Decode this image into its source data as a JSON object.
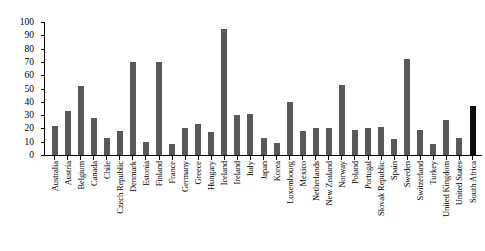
{
  "chart_data": {
    "type": "bar",
    "title": "",
    "subtitle": "",
    "xlabel": "",
    "ylabel": "",
    "ylim": [
      0,
      100
    ],
    "yticks": [
      0,
      10,
      20,
      30,
      40,
      50,
      60,
      70,
      80,
      90,
      100
    ],
    "grid": false,
    "legend": "none",
    "bar_color": "#595959",
    "highlight_color": "#0d0d0d",
    "highlight_category": "South Africa",
    "categories": [
      "Australia",
      "Austria",
      "Belgium",
      "Canada",
      "Chile",
      "Czech Republic",
      "Denmark",
      "Estonia",
      "Finland",
      "France",
      "Germany",
      "Greece",
      "Hungary",
      "Iceland",
      "Ireland",
      "Italy",
      "Japan",
      "Korea",
      "Luxembourg",
      "Mexico",
      "Netherlands",
      "New Zealand",
      "Norway",
      "Poland",
      "Portugal",
      "Slovak Republic",
      "Spain",
      "Sweden",
      "Switzerland",
      "Turkey",
      "United Kingdom",
      "United States",
      "South Africa"
    ],
    "values": [
      22,
      33,
      52,
      28,
      13,
      18,
      70,
      10,
      70,
      8,
      20,
      23,
      17,
      95,
      30,
      31,
      13,
      9,
      40,
      18,
      20,
      20,
      53,
      19,
      20,
      21,
      12,
      72,
      19,
      8,
      26,
      13,
      37
    ]
  }
}
